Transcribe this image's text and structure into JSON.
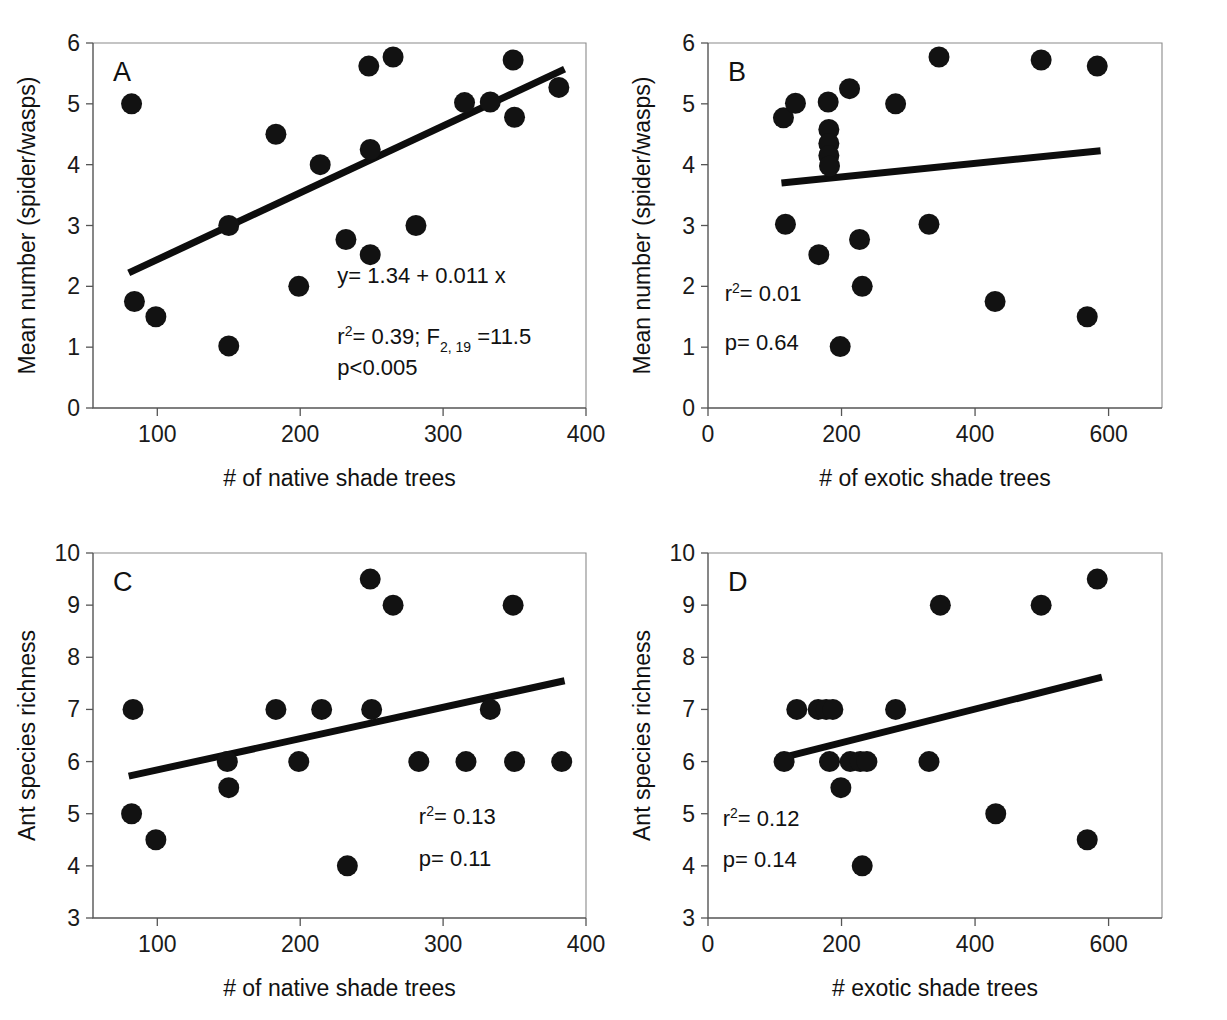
{
  "figure": {
    "background": "#ffffff",
    "point_color": "#121212",
    "line_color": "#0d0d0d"
  },
  "chart_data": [
    {
      "id": "panel-a",
      "type": "scatter",
      "panel_letter": "A",
      "title": "",
      "xlabel": "# of native shade trees",
      "ylabel": "Mean number (spider/wasps)",
      "xlim": [
        55,
        400
      ],
      "ylim": [
        0,
        6
      ],
      "xticks": [
        100,
        200,
        300,
        400
      ],
      "yticks": [
        0,
        1,
        2,
        3,
        4,
        5,
        6
      ],
      "grid": false,
      "legend": "none",
      "points": [
        {
          "x": 82,
          "y": 5.0
        },
        {
          "x": 84,
          "y": 1.75
        },
        {
          "x": 99,
          "y": 1.5
        },
        {
          "x": 150,
          "y": 3.0
        },
        {
          "x": 150,
          "y": 1.02
        },
        {
          "x": 183,
          "y": 4.5
        },
        {
          "x": 199,
          "y": 2.0
        },
        {
          "x": 214,
          "y": 4.0
        },
        {
          "x": 232,
          "y": 2.77
        },
        {
          "x": 248,
          "y": 5.62
        },
        {
          "x": 249,
          "y": 4.25
        },
        {
          "x": 249,
          "y": 2.52
        },
        {
          "x": 265,
          "y": 5.77
        },
        {
          "x": 281,
          "y": 3.0
        },
        {
          "x": 315,
          "y": 5.02
        },
        {
          "x": 333,
          "y": 5.03
        },
        {
          "x": 349,
          "y": 5.72
        },
        {
          "x": 350,
          "y": 4.78
        },
        {
          "x": 381,
          "y": 5.27
        }
      ],
      "fit_line": {
        "equation": "y= 1.34 + 0.011 x",
        "intercept": 1.34,
        "slope": 0.011,
        "x_start": 80,
        "x_end": 385,
        "y_start": 2.22,
        "y_end": 5.57
      },
      "annotations": [
        {
          "text": "y= 1.34 + 0.011 x"
        },
        {
          "text": "r2= 0.39; F2, 19 =11.5",
          "r_squared": 0.39,
          "F_value": 11.5,
          "F_df": "2, 19"
        },
        {
          "text": "p<0.005",
          "p": "<0.005"
        }
      ]
    },
    {
      "id": "panel-b",
      "type": "scatter",
      "panel_letter": "B",
      "title": "",
      "xlabel": "# of exotic shade trees",
      "ylabel": "Mean number (spider/wasps)",
      "xlim": [
        0,
        680
      ],
      "ylim": [
        0,
        6
      ],
      "xticks": [
        0,
        200,
        400,
        600
      ],
      "yticks": [
        0,
        1,
        2,
        3,
        4,
        5,
        6
      ],
      "grid": false,
      "legend": "none",
      "points": [
        {
          "x": 113,
          "y": 4.77
        },
        {
          "x": 116,
          "y": 3.02
        },
        {
          "x": 131,
          "y": 5.01
        },
        {
          "x": 166,
          "y": 2.52
        },
        {
          "x": 180,
          "y": 5.03
        },
        {
          "x": 181,
          "y": 4.58
        },
        {
          "x": 181,
          "y": 4.35
        },
        {
          "x": 181,
          "y": 4.15
        },
        {
          "x": 182,
          "y": 3.98
        },
        {
          "x": 198,
          "y": 1.01
        },
        {
          "x": 212,
          "y": 5.25
        },
        {
          "x": 227,
          "y": 2.77
        },
        {
          "x": 231,
          "y": 2.0
        },
        {
          "x": 281,
          "y": 5.0
        },
        {
          "x": 331,
          "y": 3.02
        },
        {
          "x": 346,
          "y": 5.77
        },
        {
          "x": 430,
          "y": 1.75
        },
        {
          "x": 499,
          "y": 5.72
        },
        {
          "x": 568,
          "y": 1.5
        },
        {
          "x": 583,
          "y": 5.62
        }
      ],
      "fit_line": {
        "equation": "",
        "x_start": 110,
        "x_end": 588,
        "y_start": 3.7,
        "y_end": 4.23
      },
      "annotations": [
        {
          "text": "r2= 0.01",
          "r_squared": 0.01
        },
        {
          "text": "p= 0.64",
          "p": 0.64
        }
      ]
    },
    {
      "id": "panel-c",
      "type": "scatter",
      "panel_letter": "C",
      "title": "",
      "xlabel": "# of native shade trees",
      "ylabel": "Ant species richness",
      "xlim": [
        55,
        400
      ],
      "ylim": [
        3,
        10
      ],
      "xticks": [
        100,
        200,
        300,
        400
      ],
      "yticks": [
        3,
        4,
        5,
        6,
        7,
        8,
        9,
        10
      ],
      "grid": false,
      "legend": "none",
      "points": [
        {
          "x": 83,
          "y": 7.0
        },
        {
          "x": 82,
          "y": 5.0
        },
        {
          "x": 99,
          "y": 4.5
        },
        {
          "x": 149,
          "y": 6.0
        },
        {
          "x": 150,
          "y": 5.5
        },
        {
          "x": 183,
          "y": 7.0
        },
        {
          "x": 199,
          "y": 6.0
        },
        {
          "x": 215,
          "y": 7.0
        },
        {
          "x": 233,
          "y": 4.0
        },
        {
          "x": 249,
          "y": 9.5
        },
        {
          "x": 250,
          "y": 7.0
        },
        {
          "x": 265,
          "y": 9.0
        },
        {
          "x": 283,
          "y": 6.0
        },
        {
          "x": 316,
          "y": 6.0
        },
        {
          "x": 333,
          "y": 7.0
        },
        {
          "x": 349,
          "y": 9.0
        },
        {
          "x": 350,
          "y": 6.0
        },
        {
          "x": 383,
          "y": 6.0
        }
      ],
      "fit_line": {
        "equation": "",
        "x_start": 80,
        "x_end": 385,
        "y_start": 5.72,
        "y_end": 7.55
      },
      "annotations": [
        {
          "text": "r2= 0.13",
          "r_squared": 0.13
        },
        {
          "text": "p= 0.11",
          "p": 0.11
        }
      ]
    },
    {
      "id": "panel-d",
      "type": "scatter",
      "panel_letter": "D",
      "title": "",
      "xlabel": "# exotic shade trees",
      "ylabel": "Ant species richness",
      "xlim": [
        0,
        680
      ],
      "ylim": [
        3,
        10
      ],
      "xticks": [
        0,
        200,
        400,
        600
      ],
      "yticks": [
        3,
        4,
        5,
        6,
        7,
        8,
        9,
        10
      ],
      "grid": false,
      "legend": "none",
      "points": [
        {
          "x": 114,
          "y": 6.0
        },
        {
          "x": 133,
          "y": 7.0
        },
        {
          "x": 165,
          "y": 7.0
        },
        {
          "x": 177,
          "y": 7.0
        },
        {
          "x": 182,
          "y": 6.0
        },
        {
          "x": 187,
          "y": 7.0
        },
        {
          "x": 199,
          "y": 5.5
        },
        {
          "x": 213,
          "y": 6.0
        },
        {
          "x": 228,
          "y": 6.0
        },
        {
          "x": 231,
          "y": 4.0
        },
        {
          "x": 238,
          "y": 6.0
        },
        {
          "x": 281,
          "y": 7.0
        },
        {
          "x": 331,
          "y": 6.0
        },
        {
          "x": 348,
          "y": 9.0
        },
        {
          "x": 431,
          "y": 5.0
        },
        {
          "x": 499,
          "y": 9.0
        },
        {
          "x": 568,
          "y": 4.5
        },
        {
          "x": 583,
          "y": 9.5
        }
      ],
      "fit_line": {
        "equation": "",
        "x_start": 110,
        "x_end": 590,
        "y_start": 6.07,
        "y_end": 7.62
      },
      "annotations": [
        {
          "text": "r2= 0.12",
          "r_squared": 0.12
        },
        {
          "text": "p= 0.14",
          "p": 0.14
        }
      ]
    }
  ],
  "panels": {
    "a": {
      "letter": "A",
      "xlabel": "# of native shade trees",
      "ylabel": "Mean number (spider/wasps)",
      "annot_equation": "y= 1.34 + 0.011 x",
      "annot_r2_prefix": "r",
      "annot_r2_sup": "2",
      "annot_r2_value": "= 0.39; F",
      "annot_f_sub": "2, 19",
      "annot_f_value": " =11.5",
      "annot_p": "p<0.005"
    },
    "b": {
      "letter": "B",
      "xlabel": "# of exotic shade trees",
      "ylabel": "Mean number (spider/wasps)",
      "annot_r2_prefix": "r",
      "annot_r2_sup": "2",
      "annot_r2_value": "= 0.01",
      "annot_p": "p= 0.64"
    },
    "c": {
      "letter": "C",
      "xlabel": "# of native shade trees",
      "ylabel": "Ant species richness",
      "annot_r2_prefix": "r",
      "annot_r2_sup": "2",
      "annot_r2_value": "= 0.13",
      "annot_p": "p= 0.11"
    },
    "d": {
      "letter": "D",
      "xlabel": "# exotic shade trees",
      "ylabel": "Ant species richness",
      "annot_r2_prefix": "r",
      "annot_r2_sup": "2",
      "annot_r2_value": "= 0.12",
      "annot_p": "p= 0.14"
    }
  }
}
